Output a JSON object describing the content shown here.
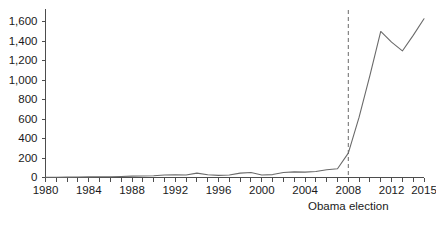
{
  "chart_data": {
    "type": "line",
    "title": "",
    "subtitle": "",
    "xlabel": "",
    "ylabel": "",
    "grid": false,
    "legend": null,
    "xlim": [
      1980,
      2015
    ],
    "ylim": [
      0,
      1700
    ],
    "y_ticks": [
      0,
      200,
      400,
      600,
      800,
      1000,
      1200,
      1400,
      1600
    ],
    "y_tick_labels": [
      "0",
      "200",
      "400",
      "600",
      "800",
      "1,000",
      "1,200",
      "1,400",
      "1,600"
    ],
    "x_ticks": [
      1980,
      1984,
      1988,
      1992,
      1996,
      2000,
      2004,
      2008,
      2012,
      2015
    ],
    "x_tick_labels": [
      "1980",
      "1984",
      "1988",
      "1992",
      "1996",
      "2000",
      "2004",
      "2008",
      "2012",
      "2015"
    ],
    "x_minor_ticks": [
      1981,
      1982,
      1983,
      1985,
      1986,
      1987,
      1989,
      1990,
      1991,
      1993,
      1994,
      1995,
      1997,
      1998,
      1999,
      2001,
      2002,
      2003,
      2005,
      2006,
      2007,
      2009,
      2010,
      2011,
      2013,
      2014
    ],
    "series": [
      {
        "name": "value",
        "color": "#6a6a6a",
        "x": [
          1980,
          1981,
          1982,
          1983,
          1984,
          1985,
          1986,
          1987,
          1988,
          1989,
          1990,
          1991,
          1992,
          1993,
          1994,
          1995,
          1996,
          1997,
          1998,
          1999,
          2000,
          2001,
          2002,
          2003,
          2004,
          2005,
          2006,
          2007,
          2008,
          2009,
          2010,
          2011,
          2012,
          2013,
          2014,
          2015
        ],
        "values": [
          2,
          2,
          3,
          3,
          4,
          5,
          6,
          8,
          12,
          14,
          16,
          22,
          26,
          24,
          40,
          26,
          20,
          22,
          40,
          48,
          24,
          28,
          48,
          54,
          50,
          58,
          74,
          84,
          96,
          112,
          108,
          104,
          120,
          122,
          120,
          122
        ]
      }
    ],
    "annotations": [
      {
        "name": "obama-election",
        "label": "Obama election",
        "x": 2008,
        "style": "dashed-vertical-line"
      }
    ]
  },
  "chart_series_full": {
    "x": [
      1980,
      1981,
      1982,
      1983,
      1984,
      1985,
      1986,
      1987,
      1988,
      1989,
      1990,
      1991,
      1992,
      1993,
      1994,
      1995,
      1996,
      1997,
      1998,
      1999,
      2000,
      2001,
      2002,
      2003,
      2004,
      2005,
      2006,
      2007,
      2008,
      2009,
      2010,
      2011,
      2012,
      2013,
      2014,
      2015
    ],
    "values": [
      3,
      3,
      4,
      5,
      6,
      7,
      8,
      10,
      14,
      15,
      18,
      25,
      28,
      26,
      45,
      28,
      22,
      25,
      45,
      52,
      26,
      30,
      52,
      58,
      55,
      62,
      80,
      90,
      250,
      620,
      1050,
      1500,
      1390,
      1300,
      1460,
      1630
    ]
  },
  "colors": {
    "line": "#6a6a6a",
    "axis": "#4d4d4d",
    "text": "#1a1a1a",
    "background": "#ffffff",
    "event_line": "#6a6a6a"
  }
}
